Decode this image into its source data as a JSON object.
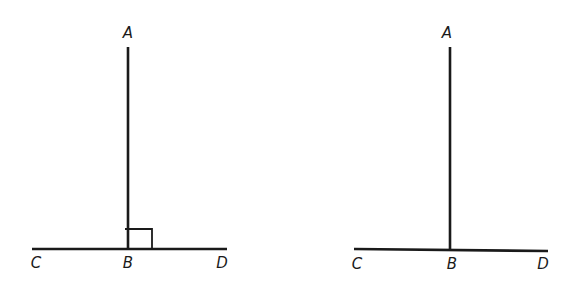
{
  "figures": [
    {
      "id": "left",
      "description": "Perpendicular line AB on line CD with right-angle mark at B",
      "right_angle_mark": true,
      "labels": {
        "A": "A",
        "B": "B",
        "C": "C",
        "D": "D"
      },
      "points": {
        "A": [
          128,
          47
        ],
        "B": [
          128,
          249
        ],
        "C": [
          32,
          249
        ],
        "D": [
          227,
          249
        ]
      },
      "label_pos": {
        "A": [
          128,
          33
        ],
        "B": [
          128,
          263
        ],
        "C": [
          36,
          263
        ],
        "D": [
          222,
          263
        ]
      }
    },
    {
      "id": "right",
      "description": "Line AB meeting line CD at B without right-angle mark",
      "right_angle_mark": false,
      "labels": {
        "A": "A",
        "B": "B",
        "C": "C",
        "D": "D"
      },
      "points": {
        "A": [
          450,
          47
        ],
        "B": [
          450,
          250
        ],
        "C": [
          354,
          249
        ],
        "D": [
          548,
          251
        ]
      },
      "label_pos": {
        "A": [
          447,
          33
        ],
        "B": [
          452,
          264
        ],
        "C": [
          357,
          264
        ],
        "D": [
          543,
          264
        ]
      }
    }
  ],
  "colors": {
    "line": "#1a1a1a",
    "background": "#ffffff"
  }
}
